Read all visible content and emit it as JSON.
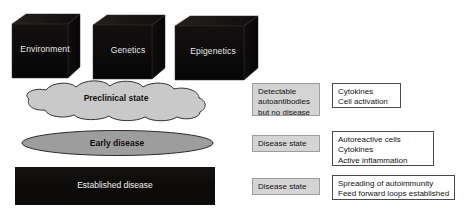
{
  "figure": {
    "background_color": "#ffffff"
  },
  "factors": {
    "shape": "3d-cube",
    "fill_color": "#0d0b0a",
    "label_color": "#e9e9e9",
    "items": [
      {
        "id": "environment",
        "label": "Environment"
      },
      {
        "id": "genetics",
        "label": "Genetics"
      },
      {
        "id": "epigenetics",
        "label": "Epigenetics"
      }
    ]
  },
  "stages": [
    {
      "id": "preclinical",
      "label": "Preclinical state",
      "shape": "cloud",
      "fill_color": "#c9c9c9",
      "stroke_color": "#2f2f2f",
      "text_color": "#15120f"
    },
    {
      "id": "early-disease",
      "label": "Early disease",
      "shape": "ellipse",
      "fill_color": "#9d9d9d",
      "stroke_color": "#2b2b2b",
      "text_color": "#120f0d"
    },
    {
      "id": "established-disease",
      "label": "Established disease",
      "shape": "rectangle",
      "fill_color": "#0d0c0b",
      "stroke_color": "#0d0c0b",
      "text_color": "#f2f2f2"
    }
  ],
  "annotations": {
    "row_1": {
      "state_box": {
        "style": "filled",
        "lines": [
          "Detectable",
          "autoantibodies",
          "but no disease"
        ]
      },
      "detail_box": {
        "style": "outlined",
        "lines": [
          "Cytokines",
          "Cell activation"
        ]
      }
    },
    "row_2": {
      "state_box": {
        "style": "filled",
        "lines": [
          "Disease state"
        ]
      },
      "detail_box": {
        "style": "outlined",
        "lines": [
          "Autoreactive cells",
          "Cytokines",
          "Active inflammation"
        ]
      }
    },
    "row_3": {
      "state_box": {
        "style": "filled",
        "lines": [
          "Disease state"
        ]
      },
      "detail_box": {
        "style": "outlined",
        "lines": [
          "Spreading of autoimmunity",
          "Feed forward loops established"
        ]
      }
    }
  }
}
